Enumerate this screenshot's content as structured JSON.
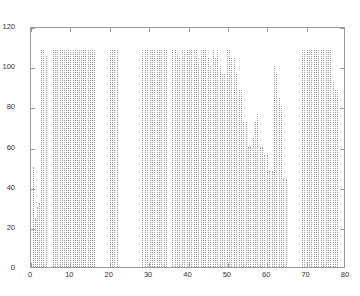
{
  "chart_data": {
    "type": "bar",
    "title": "",
    "subtitle": "",
    "xlabel": "",
    "ylabel": "",
    "xlim": [
      0,
      80
    ],
    "ylim": [
      0,
      120
    ],
    "xticks": [
      0,
      10,
      20,
      30,
      40,
      50,
      60,
      70,
      80
    ],
    "yticks": [
      0,
      20,
      40,
      60,
      80,
      100,
      120
    ],
    "grid": false,
    "legend": null,
    "legend_position": "none",
    "series_style": "dotted vertical stem lines, gray",
    "line_color": "#9b9b9b",
    "axis_color": "#9a9a9a",
    "x": [
      0.4,
      0.9,
      1.4,
      2.1,
      2.6,
      3.1,
      3.7,
      5.6,
      6.1,
      6.6,
      7.4,
      7.9,
      8.4,
      8.9,
      9.5,
      10.0,
      10.6,
      11.1,
      11.6,
      12.2,
      12.7,
      13.3,
      13.8,
      14.4,
      14.9,
      15.5,
      16.0,
      20.0,
      20.6,
      21.2,
      21.8,
      28.3,
      28.9,
      29.5,
      30.1,
      30.7,
      31.3,
      31.9,
      32.5,
      33.1,
      33.7,
      34.3,
      35.9,
      36.5,
      37.1,
      37.7,
      38.3,
      38.9,
      39.5,
      40.1,
      40.7,
      41.3,
      41.9,
      42.5,
      43.1,
      43.7,
      44.3,
      44.9,
      45.5,
      46.1,
      46.7,
      47.3,
      47.9,
      48.5,
      49.1,
      49.7,
      50.3,
      50.9,
      51.5,
      52.1,
      52.7,
      53.3,
      53.9,
      54.5,
      55.1,
      55.7,
      56.3,
      56.9,
      57.5,
      58.1,
      58.7,
      59.3,
      59.9,
      60.5,
      61.1,
      61.7,
      62.3,
      62.9,
      63.5,
      64.1,
      64.7,
      68.8,
      69.4,
      70.0,
      70.6,
      71.2,
      71.8,
      72.4,
      73.0,
      73.6,
      74.2,
      74.8,
      75.4,
      76.0,
      76.6,
      77.2,
      77.8
    ],
    "values": [
      50,
      24,
      30,
      32,
      108,
      108,
      105,
      108,
      108,
      108,
      108,
      108,
      108,
      108,
      108,
      108,
      108,
      108,
      108,
      108,
      108,
      108,
      108,
      108,
      108,
      108,
      108,
      108,
      108,
      108,
      108,
      108,
      108,
      108,
      108,
      108,
      108,
      108,
      108,
      108,
      108,
      108,
      108,
      108,
      106,
      104,
      108,
      108,
      108,
      108,
      108,
      108,
      108,
      104,
      108,
      108,
      108,
      104,
      100,
      108,
      104,
      108,
      100,
      96,
      96,
      108,
      108,
      104,
      104,
      96,
      88,
      88,
      72,
      72,
      60,
      60,
      64,
      72,
      76,
      60,
      60,
      56,
      56,
      48,
      48,
      100,
      96,
      84,
      80,
      44,
      44,
      108,
      108,
      108,
      108,
      108,
      108,
      108,
      108,
      108,
      108,
      108,
      108,
      108,
      92,
      88,
      88
    ]
  },
  "axes": {
    "y_tick_labels": [
      "120",
      "100",
      "80",
      "60",
      "40",
      "20",
      "0"
    ],
    "x_tick_labels": [
      "0",
      "10",
      "20",
      "30",
      "40",
      "50",
      "60",
      "70",
      "80"
    ]
  }
}
